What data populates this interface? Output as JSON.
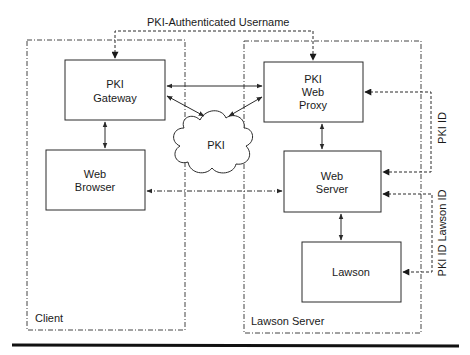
{
  "diagram": {
    "top_label": "PKI-Authenticated Username",
    "regions": {
      "client": {
        "label": "Client"
      },
      "lawson_server": {
        "label": "Lawson Server"
      }
    },
    "nodes": {
      "pki_gateway": {
        "line1": "PKI",
        "line2": "Gateway"
      },
      "web_browser": {
        "line1": "Web",
        "line2": "Browser"
      },
      "pki_cloud": {
        "label": "PKI"
      },
      "pki_web_proxy": {
        "line1": "PKI",
        "line2": "Web",
        "line3": "Proxy"
      },
      "web_server": {
        "line1": "Web",
        "line2": "Server"
      },
      "lawson": {
        "label": "Lawson"
      }
    },
    "side_labels": {
      "pki_id": "PKI ID",
      "pki_id_lawson_id": "PKI ID Lawson ID"
    }
  },
  "colors": {
    "line": "#2a2a2a",
    "background": "#ffffff"
  }
}
